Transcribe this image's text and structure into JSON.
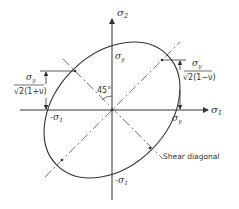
{
  "diagram": {
    "axes": {
      "x_label": "σ",
      "x_sub": "1",
      "y_label": "σ",
      "y_sub": "2"
    },
    "angle_label": "45°",
    "intercepts": {
      "top": {
        "label": "σ",
        "sub": "y"
      },
      "right": {
        "label": "σ",
        "sub": "y"
      },
      "left": {
        "label": "-σ",
        "sub": "1"
      },
      "bottom": {
        "label": "-σ",
        "sub": "1"
      }
    },
    "left_dimension": {
      "numerator": "σ",
      "numerator_sub": "y",
      "denominator": "√2(1+ν)"
    },
    "right_dimension": {
      "numerator": "σ",
      "numerator_sub": "y",
      "denominator": "√2(1−ν)"
    },
    "shear_label": "Shear diagonal",
    "colors": {
      "line": "#333333",
      "dashdot": "#555555",
      "background": "#ffffff"
    }
  }
}
